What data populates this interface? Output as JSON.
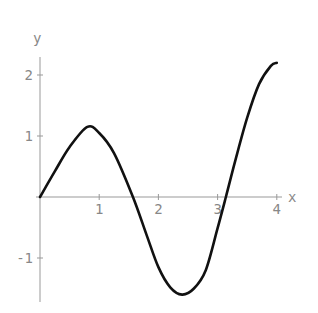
{
  "chart_data": {
    "type": "line",
    "title": "",
    "xlabel": "x",
    "ylabel": "y",
    "xlim": [
      0,
      4
    ],
    "ylim": [
      -1.6,
      2.25
    ],
    "grid": false,
    "legend": null,
    "x_ticks": [
      "1",
      "2",
      "3",
      "4"
    ],
    "y_ticks": [
      "-1",
      "1",
      "2"
    ],
    "series": [
      {
        "name": "curve",
        "x": [
          0,
          0.25,
          0.5,
          0.8,
          1.0,
          1.25,
          1.57,
          1.8,
          2.0,
          2.2,
          2.4,
          2.6,
          2.8,
          3.0,
          3.14,
          3.3,
          3.5,
          3.7,
          3.9,
          4.0
        ],
        "y": [
          0,
          0.42,
          0.82,
          1.15,
          1.05,
          0.72,
          0,
          -0.62,
          -1.15,
          -1.48,
          -1.6,
          -1.5,
          -1.2,
          -0.51,
          0,
          0.6,
          1.3,
          1.85,
          2.15,
          2.2
        ]
      }
    ]
  }
}
